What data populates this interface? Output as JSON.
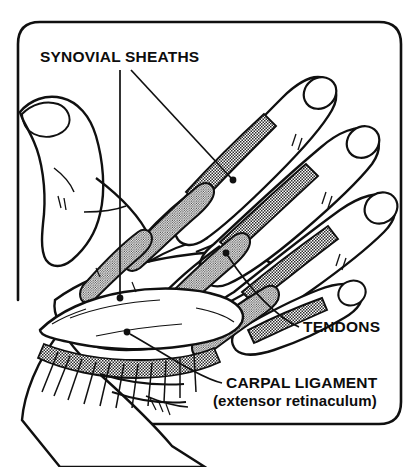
{
  "figure": {
    "title_visible": false,
    "background_color": "#ffffff",
    "ink_color": "#101010",
    "shading_color": "#9a9a9a",
    "frame": {
      "name": "rounded-border-frame",
      "stroke_width": 2.6,
      "corner_radius": 22,
      "left": 18,
      "top": 22,
      "right": 401,
      "bottom": 424,
      "open_bottom_left": true
    }
  },
  "labels": [
    {
      "id": "synovial-sheaths",
      "text": "SYNOVIAL SHEATHS",
      "x": 40,
      "y": 62,
      "anchor": "start",
      "style": "main",
      "leaders": [
        {
          "type": "vertical",
          "from_x": 120,
          "from_y": 70,
          "to_x": 120,
          "to_y": 298,
          "dot": true
        },
        {
          "type": "diagonal",
          "from_x": 131,
          "from_y": 70,
          "to_x": 233,
          "to_y": 180,
          "dot": true
        }
      ]
    },
    {
      "id": "tendons",
      "text": "TENDONS",
      "x": 303,
      "y": 332,
      "anchor": "start",
      "style": "main",
      "leaders": [
        {
          "type": "curve",
          "from_x": 298,
          "from_y": 326,
          "to_x": 226,
          "to_y": 253,
          "dot": true
        }
      ]
    },
    {
      "id": "carpal-ligament",
      "text": "CARPAL LIGAMENT",
      "x": 226,
      "y": 388,
      "anchor": "start",
      "style": "main",
      "leaders": [
        {
          "type": "curve",
          "from_x": 221,
          "from_y": 383,
          "to_x": 127,
          "to_y": 332,
          "dot": true
        }
      ]
    },
    {
      "id": "extensor-retinaculum",
      "text": "(extensor retinaculum)",
      "x": 213,
      "y": 406,
      "anchor": "start",
      "style": "sub",
      "leaders": []
    }
  ],
  "anatomy": {
    "fingers": [
      {
        "name": "index-finger",
        "nail": true
      },
      {
        "name": "middle-finger",
        "nail": true
      },
      {
        "name": "ring-finger",
        "nail": true
      },
      {
        "name": "little-finger",
        "nail": true
      },
      {
        "name": "thumb",
        "nail": true
      }
    ],
    "structures": [
      {
        "name": "synovial-sheath",
        "count": 4,
        "shading": "halftone"
      },
      {
        "name": "extensor-tendon",
        "count": 5,
        "shading": "halftone"
      },
      {
        "name": "extensor-retinaculum-band",
        "count": 1,
        "shading": "white"
      },
      {
        "name": "forearm",
        "count": 1,
        "shading": "white"
      }
    ]
  }
}
